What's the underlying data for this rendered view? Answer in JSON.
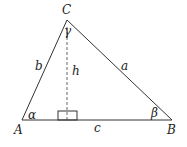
{
  "diagram": {
    "type": "triangle",
    "vertices": {
      "A": {
        "label": "A",
        "x": 22,
        "y": 120
      },
      "B": {
        "label": "B",
        "x": 172,
        "y": 120
      },
      "C": {
        "label": "C",
        "x": 67,
        "y": 20
      }
    },
    "sides": {
      "a": "a",
      "b": "b",
      "c": "c"
    },
    "angles": {
      "alpha": "α",
      "beta": "β",
      "gamma": "γ"
    },
    "altitude": {
      "label": "h",
      "style": "dashed"
    },
    "colors": {
      "stroke": "#333333",
      "text": "#222222",
      "background": "#ffffff"
    }
  }
}
